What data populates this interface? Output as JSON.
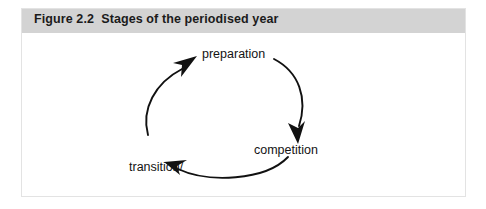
{
  "figure": {
    "number": "Figure 2.2",
    "caption": "Figure 2.2  Stages of the periodised year",
    "title": "Stages of the periodised year",
    "header_color": "#d3d3d3",
    "border_color": "#e3e3e3",
    "background_color": "#ffffff"
  },
  "diagram": {
    "type": "cycle",
    "direction": "clockwise",
    "stroke_color": "#111111",
    "stages": [
      {
        "id": "preparation",
        "label": "preparation",
        "position": "top"
      },
      {
        "id": "competition",
        "label": "competition",
        "position": "right"
      },
      {
        "id": "transition-recovery",
        "label": "transition/\nrecovery",
        "label_line1": "transition/",
        "label_line2": "recovery",
        "position": "left"
      }
    ],
    "arrows": [
      {
        "id": "arrow-transition-to-preparation",
        "from": "transition-recovery",
        "to": "preparation"
      },
      {
        "id": "arrow-preparation-to-competition",
        "from": "preparation",
        "to": "competition"
      },
      {
        "id": "arrow-competition-to-transition",
        "from": "competition",
        "to": "transition-recovery"
      }
    ]
  }
}
